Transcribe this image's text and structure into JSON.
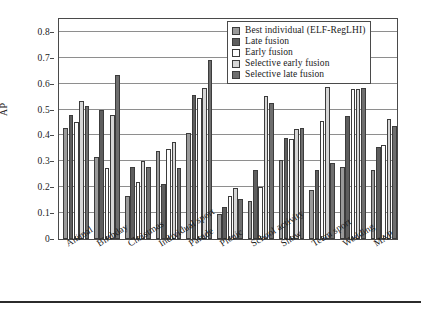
{
  "chart_data": {
    "type": "bar",
    "title": "",
    "xlabel": "",
    "ylabel": "AP",
    "ylim": [
      0,
      0.85
    ],
    "yticks": [
      "0",
      "0.1",
      "0.2",
      "0.3",
      "0.4",
      "0.5",
      "0.6",
      "0.7",
      "0.8"
    ],
    "ytick_values": [
      0,
      0.1,
      0.2,
      0.3,
      0.4,
      0.5,
      0.6,
      0.7,
      0.8
    ],
    "grid": true,
    "legend_position": "top-right",
    "categories": [
      "Animal",
      "Birthday",
      "Christmas",
      "Individual sport",
      "Parade",
      "Picnic",
      "School activity",
      "Show",
      "Team sport",
      "Wedding",
      "MAP"
    ],
    "series": [
      {
        "name": "Best individual (ELF-RegLHI)",
        "color": "#9a9a9a",
        "values": [
          0.43,
          0.318,
          0.166,
          0.341,
          0.408,
          0.098,
          0.148,
          0.307,
          0.188,
          0.28,
          0.267
        ]
      },
      {
        "name": "Late fusion",
        "color": "#5e5e5e",
        "values": [
          0.479,
          0.499,
          0.28,
          0.212,
          0.557,
          0.122,
          0.268,
          0.392,
          0.265,
          0.475,
          0.355
        ]
      },
      {
        "name": "Early fusion",
        "color": "#fdfdfd",
        "values": [
          0.452,
          0.275,
          0.22,
          0.349,
          0.545,
          0.168,
          0.2,
          0.385,
          0.455,
          0.58,
          0.362
        ]
      },
      {
        "name": "Selective early fusion",
        "color": "#d6d6d6",
        "values": [
          0.534,
          0.48,
          0.301,
          0.375,
          0.585,
          0.198,
          0.552,
          0.425,
          0.588,
          0.58,
          0.462
        ]
      },
      {
        "name": "Selective late fusion",
        "color": "#6e6e6e",
        "values": [
          0.513,
          0.632,
          0.279,
          0.276,
          0.691,
          0.155,
          0.525,
          0.428,
          0.295,
          0.585,
          0.437
        ]
      }
    ]
  }
}
